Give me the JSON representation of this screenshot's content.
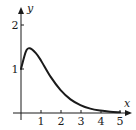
{
  "chart_data": {
    "type": "line",
    "title": "",
    "xlabel": "x",
    "ylabel": "y",
    "xlim": [
      0,
      5
    ],
    "ylim": [
      0,
      2
    ],
    "grid": false,
    "legend": null,
    "x_ticks": [
      "1",
      "2",
      "3",
      "4",
      "5"
    ],
    "y_ticks": [
      "1",
      "2"
    ],
    "series": [
      {
        "name": "f(x)",
        "x": [
          0,
          0.25,
          0.45,
          0.75,
          1,
          1.5,
          2,
          2.5,
          3,
          3.5,
          4,
          4.5,
          5
        ],
        "values": [
          1.0,
          1.4,
          1.47,
          1.36,
          1.2,
          0.82,
          0.52,
          0.31,
          0.18,
          0.1,
          0.056,
          0.03,
          0.016
        ]
      }
    ],
    "annotations": []
  },
  "labels": {
    "x_axis": "x",
    "y_axis": "y",
    "x_tick_1": "1",
    "x_tick_2": "2",
    "x_tick_3": "3",
    "x_tick_4": "4",
    "x_tick_5": "5",
    "y_tick_1": "1",
    "y_tick_2": "2"
  },
  "colors": {
    "ink": "#1a1a1a",
    "background": "#ffffff"
  }
}
